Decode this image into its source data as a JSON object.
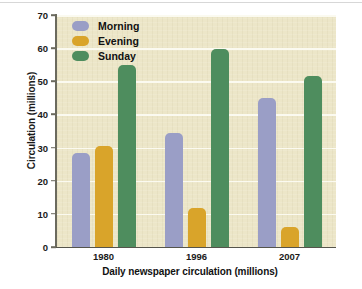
{
  "chart_data": {
    "type": "bar",
    "title": "",
    "subtitle": "",
    "xlabel": "Daily newspaper circulation (millions)",
    "ylabel": "Circulation (millions)",
    "categories": [
      "1980",
      "1996",
      "2007"
    ],
    "series": [
      {
        "name": "Morning",
        "color": "#9a9ec6",
        "values": [
          28.5,
          34.5,
          45.0
        ]
      },
      {
        "name": "Evening",
        "color": "#d9a42a",
        "values": [
          30.4,
          11.8,
          5.9
        ]
      },
      {
        "name": "Sunday",
        "color": "#4e8d5e",
        "values": [
          55.0,
          59.8,
          51.5
        ]
      }
    ],
    "ylim": [
      0,
      70
    ],
    "ytick_step": 10,
    "yticks": [
      "70",
      "60",
      "50",
      "40",
      "30",
      "20",
      "10",
      "0"
    ],
    "grid": "horizontal",
    "legend_position": "upper-left-inside",
    "plot_background": "#ece6c8",
    "gridline_color": "#fbfaf0",
    "axis_color": "#6b6a5e"
  },
  "legend": {
    "items": [
      {
        "label": "Morning"
      },
      {
        "label": "Evening"
      },
      {
        "label": "Sunday"
      }
    ]
  }
}
